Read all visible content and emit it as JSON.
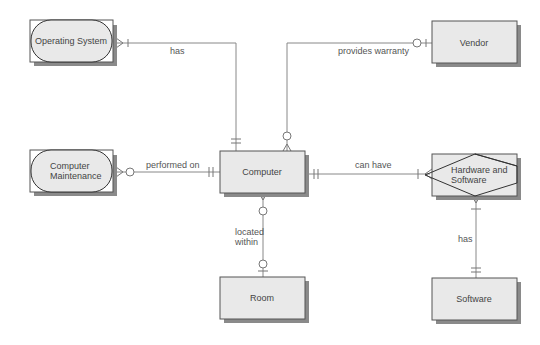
{
  "diagram": {
    "type": "entity-relationship",
    "entities": [
      {
        "id": "operating_system",
        "label": "Operating System",
        "shape": "rounded"
      },
      {
        "id": "vendor",
        "label": "Vendor",
        "shape": "rectangle"
      },
      {
        "id": "computer_maintenance",
        "label_lines": [
          "Computer",
          "Maintenance"
        ],
        "shape": "rounded"
      },
      {
        "id": "computer",
        "label": "Computer",
        "shape": "rectangle"
      },
      {
        "id": "hardware_and_software",
        "label_lines": [
          "Hardware and",
          "Software"
        ],
        "shape": "diamond-in-rectangle"
      },
      {
        "id": "room",
        "label": "Room",
        "shape": "rectangle"
      },
      {
        "id": "software",
        "label": "Software",
        "shape": "rectangle"
      }
    ],
    "relationships": [
      {
        "from": "operating_system",
        "to": "computer",
        "label": "has",
        "from_cardinality": "many-one",
        "to_cardinality": "one-and-only-one"
      },
      {
        "from": "vendor",
        "to": "computer",
        "label": "provides warranty",
        "from_cardinality": "zero-or-one",
        "to_cardinality": "zero-or-many"
      },
      {
        "from": "computer_maintenance",
        "to": "computer",
        "label": "performed on",
        "from_cardinality": "zero-or-many",
        "to_cardinality": "one-and-only-one"
      },
      {
        "from": "computer",
        "to": "hardware_and_software",
        "label": "can have",
        "from_cardinality": "one-and-only-one",
        "to_cardinality": "one-or-many"
      },
      {
        "from": "computer",
        "to": "room",
        "label_lines": [
          "located",
          "within"
        ],
        "from_cardinality": "zero-or-many",
        "to_cardinality": "zero-or-one"
      },
      {
        "from": "hardware_and_software",
        "to": "software",
        "label": "has",
        "from_cardinality": "one-or-many",
        "to_cardinality": "one-and-only-one"
      }
    ]
  },
  "labels": {
    "operating_system": "Operating System",
    "vendor": "Vendor",
    "computer_maintenance_1": "Computer",
    "computer_maintenance_2": "Maintenance",
    "computer": "Computer",
    "hw_sw_1": "Hardware and",
    "hw_sw_2": "Software",
    "room": "Room",
    "software": "Software",
    "rel_has_os": "has",
    "rel_provides_warranty": "provides warranty",
    "rel_performed_on": "performed on",
    "rel_can_have": "can have",
    "rel_located_1": "located",
    "rel_located_2": "within",
    "rel_has_sw": "has"
  },
  "colors": {
    "entity_fill": "#e9e9e9",
    "entity_border": "#555555",
    "shadow": "#8a8a8a",
    "line": "#888888",
    "text": "#444444"
  }
}
